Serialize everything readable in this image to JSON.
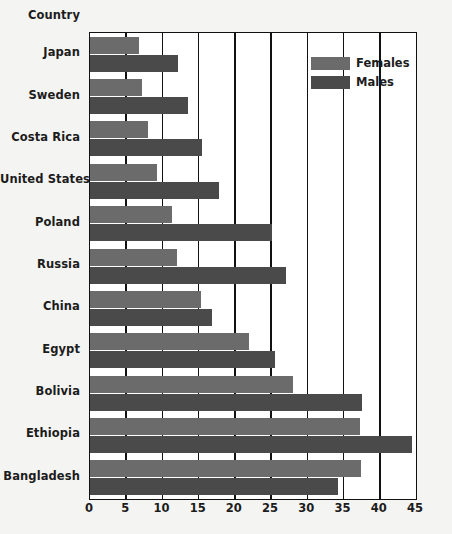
{
  "chart_data": {
    "type": "bar",
    "orientation": "horizontal",
    "title": "",
    "xlabel": "",
    "ylabel": "Country",
    "xlim": [
      0,
      45
    ],
    "xticks": [
      0,
      5,
      10,
      15,
      20,
      25,
      30,
      35,
      40,
      45
    ],
    "xtick_labels": [
      "0",
      "5",
      "10",
      "15",
      "20",
      "25",
      "30",
      "35",
      "40",
      "45"
    ],
    "grid": true,
    "grid_axis": "x",
    "legend_position": "upper right",
    "categories": [
      "Japan",
      "Sweden",
      "Costa Rica",
      "United States",
      "Poland",
      "Russia",
      "China",
      "Egypt",
      "Bolivia",
      "Ethiopia",
      "Bangladesh"
    ],
    "series": [
      {
        "name": "Females",
        "color": "#6b6b6b",
        "values": [
          6.8,
          7.2,
          8.0,
          9.2,
          11.3,
          12.0,
          15.3,
          22.0,
          28.0,
          37.3,
          37.4
        ]
      },
      {
        "name": "Males",
        "color": "#4a4a4a",
        "values": [
          12.1,
          13.5,
          15.5,
          17.8,
          25.1,
          27.0,
          16.8,
          25.5,
          37.5,
          44.5,
          34.3
        ]
      }
    ]
  },
  "legend": {
    "items": [
      {
        "label": "Females",
        "color": "#6b6b6b"
      },
      {
        "label": "Males",
        "color": "#4a4a4a"
      }
    ]
  },
  "axis": {
    "y_title": "Country"
  }
}
